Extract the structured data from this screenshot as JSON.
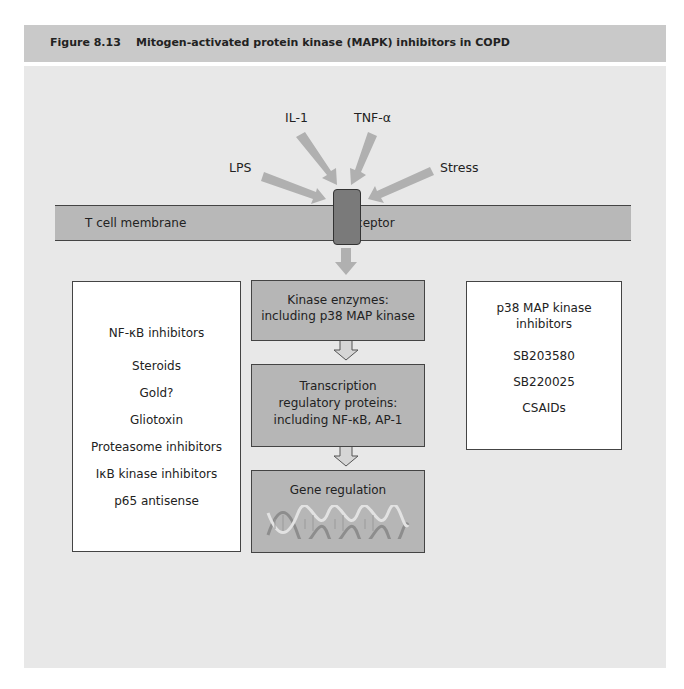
{
  "figure": {
    "number": "Figure 8.13",
    "title": "Mitogen-activated protein kinase (MAPK) inhibitors in COPD"
  },
  "stimuli": {
    "il1": "IL-1",
    "tnf": "TNF-α",
    "lps": "LPS",
    "stress": "Stress"
  },
  "membrane": {
    "label": "T cell membrane",
    "receptor_label": "receptor"
  },
  "left_box": {
    "title": "NF-κB inhibitors",
    "items": [
      "Steroids",
      "Gold?",
      "Gliotoxin",
      "Proteasome inhibitors",
      "IκB kinase inhibitors",
      "p65 antisense"
    ]
  },
  "center_boxes": [
    {
      "lines": [
        "Kinase enzymes:",
        "including p38 MAP kinase"
      ]
    },
    {
      "lines": [
        "Transcription",
        "regulatory proteins:",
        "including NF-κB, AP-1"
      ]
    },
    {
      "lines": [
        "Gene regulation"
      ],
      "icon": "dna-helix-icon"
    }
  ],
  "right_box": {
    "title_lines": [
      "p38 MAP kinase",
      "inhibitors"
    ],
    "items": [
      "SB203580",
      "SB220025",
      "CSAIDs"
    ]
  },
  "colors": {
    "header_bg": "#c9c9c9",
    "panel_bg": "#e8e8e8",
    "membrane": "#b8b8b8",
    "receptor": "#7a7a7a",
    "arrow": "#b0b0b0",
    "grey_box": "#b6b6b6"
  }
}
